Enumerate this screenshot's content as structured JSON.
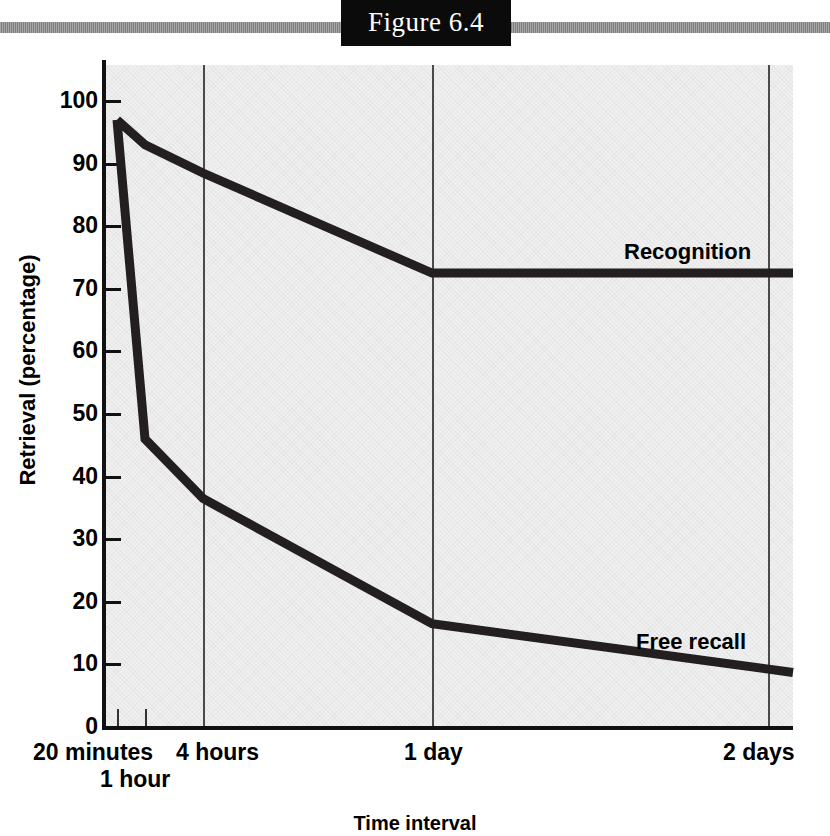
{
  "figure": {
    "label": "Figure 6.4"
  },
  "chart_data": {
    "type": "line",
    "title": "Figure 6.4",
    "xlabel": "Time interval",
    "ylabel": "Retrieval (percentage)",
    "ylim": [
      0,
      100
    ],
    "ytick_labels": [
      "100",
      "90",
      "80",
      "70",
      "60",
      "50",
      "40",
      "30",
      "20",
      "10",
      "0"
    ],
    "yticks": [
      100,
      90,
      80,
      70,
      60,
      50,
      40,
      30,
      20,
      10,
      0
    ],
    "categories": [
      "20 minutes",
      "1 hour",
      "4 hours",
      "1 day",
      "2 days"
    ],
    "xtick_labels": [
      "20 minutes",
      "1 hour",
      "4 hours",
      "1 day",
      "2 days"
    ],
    "grid": "vertical gridlines at 4 hours, 1 day, 2 days",
    "legend": "inline labels at right end of each curve",
    "series": [
      {
        "name": "Recognition",
        "values": [
          97,
          93,
          88.5,
          72.5,
          72.5
        ]
      },
      {
        "name": "Free recall",
        "values": [
          97,
          46,
          36.5,
          16.5,
          8.7
        ]
      }
    ]
  },
  "axis": {
    "y_title": "Retrieval (percentage)",
    "x_title": "Time interval",
    "x_labels": [
      {
        "text": "20 minutes",
        "row": "top"
      },
      {
        "text": "1 hour",
        "row": "bottom"
      },
      {
        "text": "4 hours",
        "row": "top"
      },
      {
        "text": "1 day",
        "row": "top"
      },
      {
        "text": "2 days",
        "row": "top"
      }
    ]
  },
  "series_labels": {
    "recognition": "Recognition",
    "free_recall": "Free recall"
  },
  "colors": {
    "line": "#231f20",
    "plot_background": "#f0f0f0",
    "banner_bar": "#8d8d8d",
    "banner_box": "#0b0b0b",
    "gridline": "#4a4a4a"
  }
}
